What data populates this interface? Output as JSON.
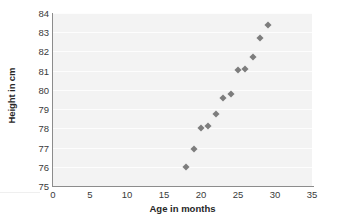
{
  "chart_data": {
    "type": "scatter",
    "title": "",
    "xlabel": "Age in months",
    "ylabel": "Height in cm",
    "xlim": [
      0,
      35
    ],
    "ylim": [
      75,
      84
    ],
    "xticks": [
      0,
      5,
      10,
      15,
      20,
      25,
      30,
      35
    ],
    "yticks": [
      75,
      76,
      77,
      78,
      79,
      80,
      81,
      82,
      83,
      84
    ],
    "grid": "horizontal",
    "legend": "none",
    "marker": "diamond",
    "marker_color": "#7d7d7d",
    "plot_background": "#f3f3f3",
    "gridline_color": "#fdfdfd",
    "axis_color": "#8c8c8c",
    "x": [
      18,
      19,
      20,
      21,
      22,
      23,
      24,
      25,
      26,
      27,
      28,
      29
    ],
    "y": [
      76.0,
      76.9,
      78.0,
      78.1,
      78.75,
      79.6,
      79.8,
      81.05,
      81.1,
      81.7,
      82.7,
      83.4
    ],
    "points": [
      {
        "x": 18,
        "y": 76.0
      },
      {
        "x": 19,
        "y": 76.9
      },
      {
        "x": 20,
        "y": 78.0
      },
      {
        "x": 21,
        "y": 78.1
      },
      {
        "x": 22,
        "y": 78.75
      },
      {
        "x": 23,
        "y": 79.6
      },
      {
        "x": 24,
        "y": 79.8
      },
      {
        "x": 25,
        "y": 81.05
      },
      {
        "x": 26,
        "y": 81.1
      },
      {
        "x": 27,
        "y": 81.7
      },
      {
        "x": 28,
        "y": 82.7
      },
      {
        "x": 29,
        "y": 83.4
      }
    ]
  }
}
